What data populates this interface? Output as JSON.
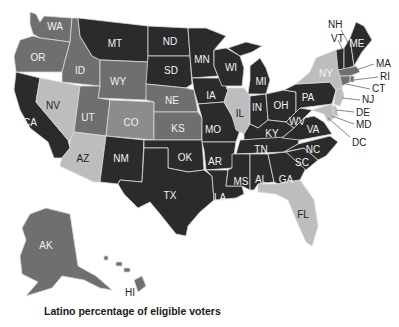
{
  "caption": "Latino percentage of eligible voters",
  "shades": {
    "darkest": "#2b2b2b",
    "medium": "#6f6f6f",
    "mid_light": "#8c8c8c",
    "light": "#bdbdbd"
  },
  "states": {
    "WA": "WA",
    "OR": "OR",
    "CA": "CA",
    "ID": "ID",
    "NV": "NV",
    "MT": "MT",
    "WY": "WY",
    "UT": "UT",
    "AZ": "AZ",
    "CO": "CO",
    "NM": "NM",
    "ND": "ND",
    "SD": "SD",
    "NE": "NE",
    "KS": "KS",
    "OK": "OK",
    "TX": "TX",
    "MN": "MN",
    "IA": "IA",
    "MO": "MO",
    "AR": "AR",
    "LA": "LA",
    "WI": "WI",
    "IL": "IL",
    "MI": "MI",
    "IN": "IN",
    "OH": "OH",
    "KY": "KY",
    "TN": "TN",
    "MS": "MS",
    "AL": "AL",
    "GA": "GA",
    "FL": "FL",
    "SC": "SC",
    "NC": "NC",
    "VA": "VA",
    "WV": "WV",
    "PA": "PA",
    "NY": "NY",
    "VT": "VT",
    "NH": "NH",
    "ME": "ME",
    "MA": "MA",
    "RI": "RI",
    "CT": "CT",
    "NJ": "NJ",
    "DE": "DE",
    "MD": "MD",
    "DC": "DC",
    "AK": "AK",
    "HI": "HI"
  },
  "state_shading": {
    "darkest": [
      "MT",
      "ND",
      "SD",
      "MN",
      "WI",
      "MI",
      "IA",
      "MO",
      "IN",
      "OH",
      "PA",
      "KY",
      "WV",
      "VA",
      "TN",
      "NC",
      "SC",
      "GA",
      "AL",
      "MS",
      "AR",
      "LA",
      "OK",
      "TX",
      "NM",
      "CA",
      "VT",
      "NH",
      "ME"
    ],
    "medium": [
      "WA",
      "OR",
      "ID",
      "WY",
      "UT",
      "NE",
      "KS",
      "AK",
      "HI",
      "MA",
      "RI",
      "CT"
    ],
    "mid_light": [
      "CO"
    ],
    "light": [
      "NV",
      "AZ",
      "IL",
      "NY",
      "NJ",
      "FL",
      "DE",
      "MD"
    ]
  }
}
